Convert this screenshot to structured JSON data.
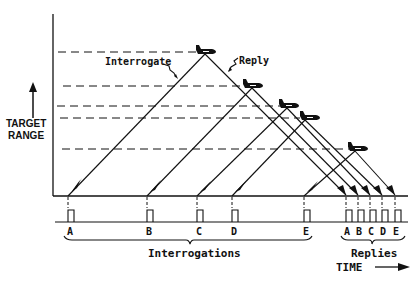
{
  "axes": {
    "y_label_line1": "TARGET",
    "y_label_line2": "RANGE",
    "x_label": "TIME"
  },
  "annotations": {
    "interrogate": "Interrogate",
    "reply": "Reply"
  },
  "groups": {
    "interrogations": "Interrogations",
    "replies": "Replies"
  },
  "interrogation_pulses": [
    {
      "label": "A",
      "x": 68
    },
    {
      "label": "B",
      "x": 147
    },
    {
      "label": "C",
      "x": 197
    },
    {
      "label": "D",
      "x": 232
    },
    {
      "label": "E",
      "x": 304
    }
  ],
  "reply_pulses": [
    {
      "label": "A",
      "x": 346
    },
    {
      "label": "B",
      "x": 358
    },
    {
      "label": "C",
      "x": 370
    },
    {
      "label": "D",
      "x": 382
    },
    {
      "label": "E",
      "x": 395
    }
  ],
  "targets": [
    {
      "id": "A",
      "x": 205,
      "range_y": 52
    },
    {
      "id": "B",
      "x": 250,
      "range_y": 86
    },
    {
      "id": "C",
      "x": 287,
      "range_y": 106
    },
    {
      "id": "D",
      "x": 305,
      "range_y": 118
    },
    {
      "id": "E",
      "x": 355,
      "range_y": 149
    }
  ],
  "colors": {
    "ink": "#111111",
    "background": "#ffffff"
  }
}
